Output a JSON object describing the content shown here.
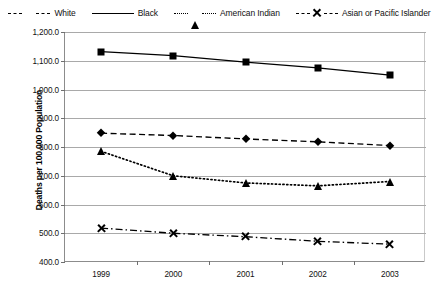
{
  "chart_data": {
    "type": "line",
    "title": "",
    "xlabel": "",
    "ylabel": "Deaths per 100,000 Population",
    "categories": [
      "1999",
      "2000",
      "2001",
      "2002",
      "2003"
    ],
    "ylim": [
      400.0,
      1200.0
    ],
    "ytick_labels": [
      "1,200.0",
      "1,100.0",
      "1,000.0",
      "900.0",
      "800.0",
      "700.0",
      "600.0",
      "500.0",
      "400.0"
    ],
    "ytick_values": [
      1200,
      1100,
      1000,
      900,
      800,
      700,
      600,
      500,
      400
    ],
    "grid": true,
    "legend_position": "top",
    "series": [
      {
        "name": "White",
        "marker": "diamond",
        "line_style": "dashed",
        "color": "#000000",
        "values": [
          848,
          840,
          828,
          818,
          805
        ]
      },
      {
        "name": "Black",
        "marker": "square",
        "line_style": "solid",
        "color": "#000000",
        "values": [
          1132,
          1118,
          1095,
          1075,
          1050
        ]
      },
      {
        "name": "American Indian",
        "marker": "triangle",
        "line_style": "dotted",
        "color": "#000000",
        "values": [
          785,
          700,
          675,
          665,
          680
        ]
      },
      {
        "name": "Asian or Pacific Islander",
        "marker": "x",
        "line_style": "dash-dot",
        "color": "#000000",
        "values": [
          518,
          500,
          488,
          472,
          462
        ]
      }
    ]
  },
  "colors": {
    "ink": "#000000",
    "grid": "#a9a9a9",
    "axis": "#8c8c8c",
    "frame": "#c9c9c9",
    "background": "#ffffff"
  }
}
